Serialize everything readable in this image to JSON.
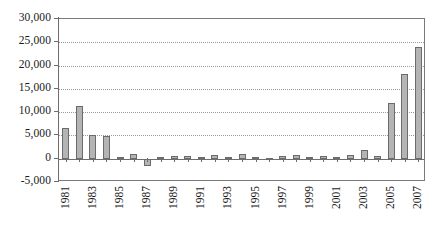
{
  "chart_data": {
    "type": "bar",
    "title": "",
    "xlabel": "",
    "ylabel": "",
    "ylim": [
      -5000,
      30000
    ],
    "ytick_step": 5000,
    "grid": true,
    "legend": false,
    "xtick_label_interval": 2,
    "categories": [
      "1981",
      "1982",
      "1983",
      "1984",
      "1985",
      "1986",
      "1987",
      "1988",
      "1989",
      "1990",
      "1991",
      "1992",
      "1993",
      "1994",
      "1995",
      "1996",
      "1997",
      "1998",
      "1999",
      "2000",
      "2001",
      "2002",
      "2003",
      "2004",
      "2005",
      "2006",
      "2007"
    ],
    "values": [
      6500,
      11300,
      5000,
      4950,
      400,
      1100,
      -1500,
      300,
      600,
      500,
      400,
      900,
      400,
      1000,
      300,
      200,
      600,
      900,
      400,
      500,
      400,
      800,
      1900,
      600,
      12000,
      18200,
      24000
    ],
    "ytick_labels": [
      "30,000",
      "25,000",
      "20,000",
      "15,000",
      "10,000",
      "5,000",
      "0",
      "-5,000"
    ],
    "ytick_values": [
      30000,
      25000,
      20000,
      15000,
      10000,
      5000,
      0,
      -5000
    ],
    "xtick_labels": [
      "1981",
      "1983",
      "1985",
      "1987",
      "1989",
      "1991",
      "1993",
      "1995",
      "1997",
      "1999",
      "2001",
      "2003",
      "2005",
      "2007"
    ],
    "colors": {
      "bar_fill": "#b4b4b4",
      "bar_border": "#6b6b6b",
      "grid": "#9a9a9a",
      "axis": "#6e6e6e",
      "text": "#1a1a1a",
      "background": "#ffffff"
    }
  }
}
